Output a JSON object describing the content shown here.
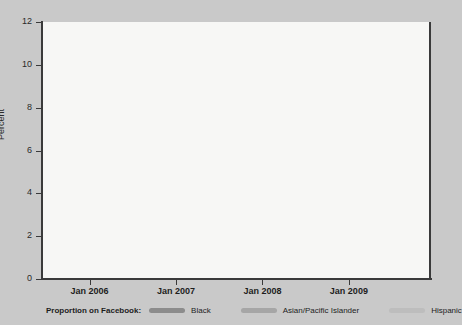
{
  "chart_data": {
    "type": "line",
    "title": "",
    "subtitle": "",
    "xlabel": "",
    "ylabel": "Percent",
    "ylim": [
      0,
      12
    ],
    "yticks": [
      0,
      2,
      4,
      6,
      8,
      10,
      12
    ],
    "ytick_labels": [
      "0",
      "2",
      "4",
      "6",
      "8",
      "10",
      "12"
    ],
    "xtick_labels": [
      "Jan 2006",
      "Jan 2007",
      "Jan 2008",
      "Jan 2009"
    ],
    "xtick_positions": [
      2006.0,
      2007.0,
      2008.0,
      2009.0
    ],
    "xlim": [
      2005.45,
      2009.95
    ],
    "grid": true,
    "legend_position": "below",
    "legend_title": "Proportion on Facebook:",
    "x": [
      2005.45,
      2005.6,
      2005.8,
      2006.0,
      2006.2,
      2006.4,
      2006.6,
      2006.8,
      2007.0,
      2007.2,
      2007.4,
      2007.6,
      2007.8,
      2008.0,
      2008.2,
      2008.4,
      2008.6,
      2008.8,
      2009.0,
      2009.2,
      2009.4,
      2009.6,
      2009.8,
      2009.95
    ],
    "series": [
      {
        "name": "Black",
        "color": "#8c8c8c",
        "values": [
          8.1,
          7.85,
          7.65,
          7.6,
          7.75,
          8.05,
          8.1,
          7.95,
          7.85,
          7.9,
          8.2,
          8.5,
          8.6,
          8.45,
          8.4,
          8.6,
          8.7,
          8.65,
          8.6,
          8.6,
          8.35,
          7.5,
          6.7,
          6.4
        ]
      },
      {
        "name": "Asian/Pacific Islander",
        "color": "#a6a6a6",
        "values": [
          6.7,
          7.15,
          7.5,
          7.6,
          7.6,
          7.7,
          7.85,
          8.0,
          7.95,
          7.75,
          7.6,
          7.55,
          7.7,
          8.1,
          8.35,
          8.4,
          8.35,
          8.45,
          8.5,
          8.45,
          8.3,
          8.25,
          8.5,
          9.1
        ]
      },
      {
        "name": "Hispanic",
        "color": "#bdbdbd",
        "values": [
          3.45,
          3.45,
          3.45,
          3.45,
          3.45,
          3.45,
          3.45,
          3.5,
          3.65,
          3.95,
          4.25,
          4.85,
          5.45,
          6.0,
          6.5,
          6.95,
          7.3,
          7.6,
          7.85,
          8.0,
          8.25,
          8.8,
          9.8,
          10.85
        ]
      }
    ]
  },
  "axes": {
    "ylabel": "Percent"
  },
  "legend": {
    "title": "Proportion on Facebook:",
    "items": [
      {
        "label": "Black",
        "color": "#8c8c8c"
      },
      {
        "label": "Asian/Pacific Islander",
        "color": "#a6a6a6"
      },
      {
        "label": "Hispanic",
        "color": "#bdbdbd"
      }
    ]
  },
  "colors": {
    "background": "#c9c9c9",
    "plot_background": "#f7f7f5",
    "axis": "#3a3a3a",
    "grid": "#b8b8b8"
  }
}
